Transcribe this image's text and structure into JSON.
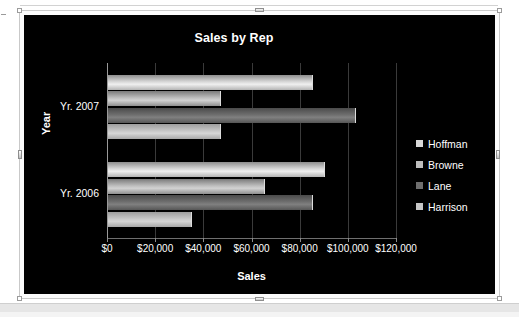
{
  "chart_data": {
    "type": "bar",
    "orientation": "horizontal",
    "title": "Sales by Rep",
    "xlabel": "Sales",
    "ylabel": "Year",
    "categories": [
      "Yr. 2007",
      "Yr. 2006"
    ],
    "series": [
      {
        "name": "Hoffman",
        "values": [
          85000,
          90000
        ],
        "color": "#d8d8d8"
      },
      {
        "name": "Browne",
        "values": [
          47000,
          65000
        ],
        "color": "#bdbdbd"
      },
      {
        "name": "Lane",
        "values": [
          103000,
          85000
        ],
        "color": "#6e6e6e"
      },
      {
        "name": "Harrison",
        "values": [
          47000,
          35000
        ],
        "color": "#c6c6c6"
      }
    ],
    "xlim": [
      0,
      120000
    ],
    "xticks": [
      0,
      20000,
      40000,
      60000,
      80000,
      100000,
      120000
    ],
    "xtick_labels": [
      "$0",
      "$20,000",
      "$40,000",
      "$60,000",
      "$80,000",
      "$100,000",
      "$120,000"
    ],
    "grid": true,
    "legend_position": "right",
    "background_color": "#000000",
    "text_color": "#ffffff"
  },
  "chart": {
    "title": "Sales by Rep",
    "axis_title_x": "Sales",
    "axis_title_y": "Year",
    "category_labels": [
      "Yr. 2007",
      "Yr. 2006"
    ],
    "tick_labels": [
      "$0",
      "$20,000",
      "$40,000",
      "$60,000",
      "$80,000",
      "$100,000",
      "$120,000"
    ],
    "legend": [
      {
        "label": "Hoffman"
      },
      {
        "label": "Browne"
      },
      {
        "label": "Lane"
      },
      {
        "label": "Harrison"
      }
    ]
  }
}
